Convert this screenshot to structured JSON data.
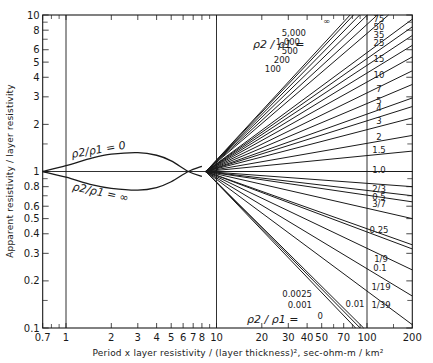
{
  "chart_data": {
    "type": "line",
    "title": "",
    "xlabel": "Period x layer resistivity / (layer thickness)², sec-ohm-m / km²",
    "ylabel": "Apparent resistivity / layer resistivity",
    "xscale": "log",
    "yscale": "log",
    "xlim": [
      0.7,
      200
    ],
    "ylim": [
      0.1,
      10
    ],
    "grid": false,
    "x_ticks": [
      0.7,
      1,
      2,
      3,
      4,
      5,
      6,
      7,
      8,
      10,
      20,
      30,
      40,
      50,
      70,
      100,
      200
    ],
    "x_tick_labels": [
      "0.7",
      "1",
      "2",
      "3",
      "4",
      "5",
      "6",
      "7",
      "8",
      "10",
      "20",
      "30",
      "40",
      "50",
      "70",
      "100",
      "200"
    ],
    "y_ticks": [
      0.1,
      0.2,
      0.3,
      0.4,
      0.5,
      0.6,
      0.8,
      1,
      2,
      3,
      4,
      5,
      6,
      8,
      10
    ],
    "y_tick_labels": [
      "0.1",
      "0.2",
      "0.3",
      "0.4",
      "0.5",
      "0.6",
      "0.8",
      "1",
      "2",
      "3",
      "4",
      "5",
      "6",
      "8",
      "10"
    ],
    "reference_lines": {
      "vertical": [
        1,
        10,
        100
      ],
      "horizontal": [
        1
      ]
    },
    "parameter_label": "ρ2 / ρ1 =",
    "low_range_series": [
      {
        "name": "ρ2/ρ1 = 0",
        "x": [
          0.7,
          1,
          1.5,
          2,
          3,
          4,
          5,
          6.5,
          8
        ],
        "y": [
          1.0,
          1.09,
          1.22,
          1.29,
          1.32,
          1.27,
          1.17,
          1.0,
          0.93
        ]
      },
      {
        "name": "ρ2/ρ1 = ∞",
        "x": [
          0.7,
          1,
          1.5,
          2,
          3,
          4,
          5,
          6.5,
          8
        ],
        "y": [
          1.0,
          0.92,
          0.82,
          0.78,
          0.76,
          0.79,
          0.86,
          1.0,
          1.08
        ]
      }
    ],
    "high_range_series": [
      {
        "name": "∞",
        "y_at_200": 27.0
      },
      {
        "name": "5,000",
        "y_at_200": 25.0
      },
      {
        "name": "1,000",
        "y_at_200": 22.0
      },
      {
        "name": "500",
        "y_at_200": 19.0
      },
      {
        "name": "200",
        "y_at_200": 16.0
      },
      {
        "name": "100",
        "y_at_200": 13.5
      },
      {
        "name": "75",
        "y_at_200": 9.4
      },
      {
        "name": "50",
        "y_at_200": 8.4
      },
      {
        "name": "35",
        "y_at_200": 7.4
      },
      {
        "name": "25",
        "y_at_200": 6.4
      },
      {
        "name": "15",
        "y_at_200": 5.4
      },
      {
        "name": "10",
        "y_at_200": 4.4
      },
      {
        "name": "7",
        "y_at_200": 3.6
      },
      {
        "name": "5",
        "y_at_200": 2.95
      },
      {
        "name": "4",
        "y_at_200": 2.6
      },
      {
        "name": "3",
        "y_at_200": 2.2
      },
      {
        "name": "2",
        "y_at_200": 1.7
      },
      {
        "name": "1.5",
        "y_at_200": 1.35
      },
      {
        "name": "1.0",
        "y_at_200": 1.0
      },
      {
        "name": "2/3",
        "y_at_200": 0.8
      },
      {
        "name": "0.5",
        "y_at_200": 0.7
      },
      {
        "name": "3/7",
        "y_at_200": 0.64
      },
      {
        "name": "0.25",
        "y_at_200": 0.5
      },
      {
        "name": "1/9",
        "y_at_200": 0.34
      },
      {
        "name": "0.1",
        "y_at_200": 0.32
      },
      {
        "name": "1/19",
        "y_at_200": 0.235
      },
      {
        "name": "1/39",
        "y_at_200": 0.16
      },
      {
        "name": "0.01",
        "y_at_200": 0.105
      },
      {
        "name": "0.0025",
        "x_at_0.1": 95
      },
      {
        "name": "0.001",
        "x_at_0.1": 90
      },
      {
        "name": "0",
        "x_at_0.1": 84
      }
    ],
    "upper_labels_left": [
      "∞",
      "5,000",
      "1,000",
      "500",
      "200",
      "100"
    ],
    "upper_labels_right": [
      "75",
      "50",
      "35",
      "25",
      "15",
      "10",
      "7",
      "5",
      "4",
      "3",
      "2",
      "1.5",
      "1.0",
      "2/3",
      "0.5",
      "3/7",
      "0.25",
      "1/9",
      "0.1",
      "1/19",
      "1/39",
      "0.01"
    ],
    "lower_labels": [
      "0.0025",
      "0.001",
      "0"
    ]
  },
  "labels": {
    "rho_zero": "ρ2/ρ1 = 0",
    "rho_inf": "ρ2/ρ1 = ∞",
    "rho_upper": "ρ2 / ρ1 =",
    "rho_lower": "ρ2 / ρ1 ="
  }
}
